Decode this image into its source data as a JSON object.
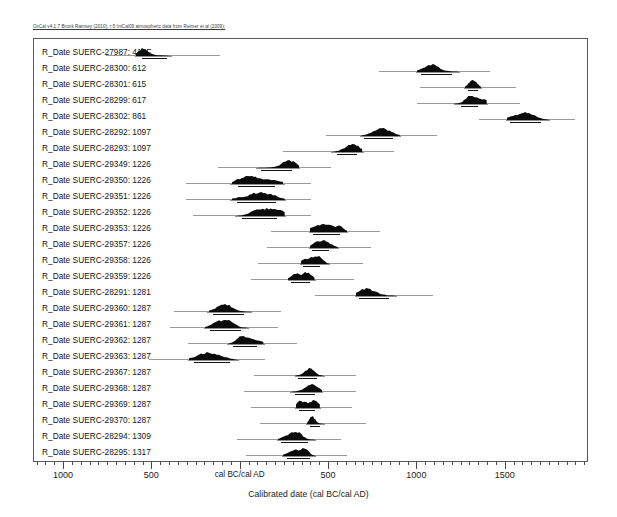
{
  "credit": "OxCal v4.1.7 Bronk Ramsey (2010); r:5 IntCal09 atmospheric data from Reimer et al (2009);",
  "axis": {
    "title": "Calibrated date (cal BC/cal AD)",
    "tick_labels": [
      "1000",
      "500",
      "cal BC/cal AD",
      "500",
      "1000",
      "1500"
    ]
  },
  "chart_data": {
    "type": "area",
    "title": "",
    "subtitle": "OxCal v4.1.7 Bronk Ramsey (2010); r:5 IntCal09 atmospheric data from Reimer et al (2009);",
    "xlabel": "Calibrated date (cal BC/cal AD)",
    "ylabel": "",
    "xlim": [
      -1170,
      1960
    ],
    "xticks": [
      -1000,
      -500,
      0,
      500,
      1000,
      1500
    ],
    "xtick_labels": [
      "1000",
      "500",
      "cal BC/cal AD",
      "500",
      "1000",
      "1500"
    ],
    "grid": false,
    "legend": false,
    "note": "OxCal multiplot of calibrated radiocarbon determinations. Each row shows the calibrated probability distribution (filled black) with 95.4% (grey) and 68.2% (black) highest-posterior-density range bars beneath.",
    "categories": [
      "R_Date SUERC-27987: 415F",
      "R_Date SUERC-28300: 612",
      "R_Date SUERC-28301: 615",
      "R_Date SUERC-28299: 617",
      "R_Date SUERC-28302: 861",
      "R_Date SUERC-28292: 1097",
      "R_Date SUERC-28293: 1097",
      "R_Date SUERC-29349: 1226",
      "R_Date SUERC-29350: 1226",
      "R_Date SUERC-29351: 1226",
      "R_Date SUERC-29352: 1226",
      "R_Date SUERC-29353: 1226",
      "R_Date SUERC-29357: 1226",
      "R_Date SUERC-29358: 1226",
      "R_Date SUERC-29359: 1226",
      "R_Date SUERC-28291: 1281",
      "R_Date SUERC-29360: 1287",
      "R_Date SUERC-29361: 1287",
      "R_Date SUERC-29362: 1287",
      "R_Date SUERC-29363: 1287",
      "R_Date SUERC-29367: 1287",
      "R_Date SUERC-29368: 1287",
      "R_Date SUERC-29369: 1287",
      "R_Date SUERC-29370: 1287",
      "R_Date SUERC-28294: 1309",
      "R_Date SUERC-28295: 1317"
    ],
    "series": [
      {
        "name": "R_Date SUERC-27987: 415F",
        "label": "R_Date SUERC-27987: 415F",
        "c14_age": 415,
        "tail_start": -760,
        "tail_end": -120,
        "pdf_start": -590,
        "pdf_end": -400,
        "range95_start": -600,
        "range95_end": -390,
        "range68_start": -560,
        "range68_end": -420
      },
      {
        "name": "R_Date SUERC-28300: 612",
        "label": "R_Date SUERC-28300: 612",
        "c14_age": 612,
        "tail_start": 780,
        "tail_end": 1410,
        "pdf_start": 1000,
        "pdf_end": 1235,
        "range95_start": 990,
        "range95_end": 1240,
        "range68_start": 1020,
        "range68_end": 1195
      },
      {
        "name": "R_Date SUERC-28301: 615",
        "label": "R_Date SUERC-28301: 615",
        "c14_age": 615,
        "tail_start": 1015,
        "tail_end": 1560,
        "pdf_start": 1270,
        "pdf_end": 1360,
        "range95_start": 1265,
        "range95_end": 1365,
        "range68_start": 1285,
        "range68_end": 1345
      },
      {
        "name": "R_Date SUERC-28299: 617",
        "label": "R_Date SUERC-28299: 617",
        "c14_age": 617,
        "tail_start": 1000,
        "tail_end": 1580,
        "pdf_start": 1210,
        "pdf_end": 1395,
        "range95_start": 1205,
        "range95_end": 1400,
        "range68_start": 1245,
        "range68_end": 1345
      },
      {
        "name": "R_Date SUERC-28302: 861",
        "label": "R_Date SUERC-28302: 861",
        "c14_age": 861,
        "tail_start": 1350,
        "tail_end": 1890,
        "pdf_start": 1505,
        "pdf_end": 1745,
        "range95_start": 1500,
        "range95_end": 1750,
        "range68_start": 1525,
        "range68_end": 1700
      },
      {
        "name": "R_Date SUERC-28292: 1097",
        "label": "R_Date SUERC-28292: 1097",
        "c14_age": 1097,
        "tail_start": 480,
        "tail_end": 1110,
        "pdf_start": 680,
        "pdf_end": 900,
        "range95_start": 675,
        "range95_end": 905,
        "range68_start": 700,
        "range68_end": 860
      },
      {
        "name": "R_Date SUERC-28293: 1097",
        "label": "R_Date SUERC-28293: 1097",
        "c14_age": 1097,
        "tail_start": 240,
        "tail_end": 870,
        "pdf_start": 525,
        "pdf_end": 690,
        "range95_start": 510,
        "range95_end": 700,
        "range68_start": 545,
        "range68_end": 660
      },
      {
        "name": "R_Date SUERC-29349: 1226",
        "label": "R_Date SUERC-29349: 1226",
        "c14_age": 1226,
        "tail_start": -130,
        "tail_end": 510,
        "pdf_start": 90,
        "pdf_end": 330,
        "range95_start": 85,
        "range95_end": 335,
        "range68_start": 115,
        "range68_end": 290
      },
      {
        "name": "R_Date SUERC-29350: 1226",
        "label": "R_Date SUERC-29350: 1226",
        "c14_age": 1226,
        "tail_start": -310,
        "tail_end": 400,
        "pdf_start": -50,
        "pdf_end": 240,
        "range95_start": -60,
        "range95_end": 250,
        "range68_start": -15,
        "range68_end": 195
      },
      {
        "name": "R_Date SUERC-29351: 1226",
        "label": "R_Date SUERC-29351: 1226",
        "c14_age": 1226,
        "tail_start": -310,
        "tail_end": 400,
        "pdf_start": -50,
        "pdf_end": 250,
        "range95_start": -60,
        "range95_end": 255,
        "range68_start": -20,
        "range68_end": 200
      },
      {
        "name": "R_Date SUERC-29352: 1226",
        "label": "R_Date SUERC-29352: 1226",
        "c14_age": 1226,
        "tail_start": -270,
        "tail_end": 400,
        "pdf_start": -20,
        "pdf_end": 250,
        "range95_start": -30,
        "range95_end": 255,
        "range68_start": 5,
        "range68_end": 205
      },
      {
        "name": "R_Date SUERC-29353: 1226",
        "label": "R_Date SUERC-29353: 1226",
        "c14_age": 1226,
        "tail_start": 170,
        "tail_end": 790,
        "pdf_start": 390,
        "pdf_end": 600,
        "range95_start": 385,
        "range95_end": 605,
        "range68_start": 410,
        "range68_end": 560
      },
      {
        "name": "R_Date SUERC-29357: 1226",
        "label": "R_Date SUERC-29357: 1226",
        "c14_age": 1226,
        "tail_start": 150,
        "tail_end": 740,
        "pdf_start": 390,
        "pdf_end": 550,
        "range95_start": 385,
        "range95_end": 555,
        "range68_start": 405,
        "range68_end": 500
      },
      {
        "name": "R_Date SUERC-29358: 1226",
        "label": "R_Date SUERC-29358: 1226",
        "c14_age": 1226,
        "tail_start": 100,
        "tail_end": 690,
        "pdf_start": 340,
        "pdf_end": 500,
        "range95_start": 335,
        "range95_end": 505,
        "range68_start": 355,
        "range68_end": 450
      },
      {
        "name": "R_Date SUERC-29359: 1226",
        "label": "R_Date SUERC-29359: 1226",
        "c14_age": 1226,
        "tail_start": 60,
        "tail_end": 640,
        "pdf_start": 270,
        "pdf_end": 420,
        "range95_start": 265,
        "range95_end": 425,
        "range68_start": 285,
        "range68_end": 395
      },
      {
        "name": "R_Date SUERC-28291: 1281",
        "label": "R_Date SUERC-28291: 1281",
        "c14_age": 1281,
        "tail_start": 420,
        "tail_end": 1090,
        "pdf_start": 650,
        "pdf_end": 880,
        "range95_start": 645,
        "range95_end": 885,
        "range68_start": 670,
        "range68_end": 840
      },
      {
        "name": "R_Date SUERC-29360: 1287",
        "label": "R_Date SUERC-29360: 1287",
        "c14_age": 1287,
        "tail_start": -380,
        "tail_end": 230,
        "pdf_start": -180,
        "pdf_end": 60,
        "range95_start": -190,
        "range95_end": 65,
        "range68_start": -155,
        "range68_end": 20
      },
      {
        "name": "R_Date SUERC-29361: 1287",
        "label": "R_Date SUERC-29361: 1287",
        "c14_age": 1287,
        "tail_start": -400,
        "tail_end": 210,
        "pdf_start": -200,
        "pdf_end": 40,
        "range95_start": -210,
        "range95_end": 45,
        "range68_start": -175,
        "range68_end": 0
      },
      {
        "name": "R_Date SUERC-29362: 1287",
        "label": "R_Date SUERC-29362: 1287",
        "c14_age": 1287,
        "tail_start": -300,
        "tail_end": 320,
        "pdf_start": -70,
        "pdf_end": 130,
        "range95_start": -80,
        "range95_end": 135,
        "range68_start": -45,
        "range68_end": 90
      },
      {
        "name": "R_Date SUERC-29363: 1287",
        "label": "R_Date SUERC-29363: 1287",
        "c14_age": 1287,
        "tail_start": -520,
        "tail_end": 140,
        "pdf_start": -290,
        "pdf_end": -20,
        "range95_start": -300,
        "range95_end": -10,
        "range68_start": -265,
        "range68_end": -60
      },
      {
        "name": "R_Date SUERC-29367: 1287",
        "label": "R_Date SUERC-29367: 1287",
        "c14_age": 1287,
        "tail_start": 75,
        "tail_end": 650,
        "pdf_start": 310,
        "pdf_end": 470,
        "range95_start": 305,
        "range95_end": 475,
        "range68_start": 325,
        "range68_end": 430
      },
      {
        "name": "R_Date SUERC-29368: 1287",
        "label": "R_Date SUERC-29368: 1287",
        "c14_age": 1287,
        "tail_start": 20,
        "tail_end": 650,
        "pdf_start": 290,
        "pdf_end": 460,
        "range95_start": 280,
        "range95_end": 465,
        "range68_start": 310,
        "range68_end": 420
      },
      {
        "name": "R_Date SUERC-29369: 1287",
        "label": "R_Date SUERC-29369: 1287",
        "c14_age": 1287,
        "tail_start": 60,
        "tail_end": 630,
        "pdf_start": 315,
        "pdf_end": 450,
        "range95_start": 310,
        "range95_end": 455,
        "range68_start": 330,
        "range68_end": 420
      },
      {
        "name": "R_Date SUERC-29370: 1287",
        "label": "R_Date SUERC-29370: 1287",
        "c14_age": 1287,
        "tail_start": 110,
        "tail_end": 710,
        "pdf_start": 375,
        "pdf_end": 470,
        "range95_start": 370,
        "range95_end": 475,
        "range68_start": 390,
        "range68_end": 450
      },
      {
        "name": "R_Date SUERC-28294: 1309",
        "label": "R_Date SUERC-28294: 1309",
        "c14_age": 1309,
        "tail_start": -20,
        "tail_end": 570,
        "pdf_start": 210,
        "pdf_end": 420,
        "range95_start": 205,
        "range95_end": 425,
        "range68_start": 230,
        "range68_end": 380
      },
      {
        "name": "R_Date SUERC-28295: 1317",
        "label": "R_Date SUERC-28295: 1317",
        "c14_age": 1317,
        "tail_start": 30,
        "tail_end": 600,
        "pdf_start": 240,
        "pdf_end": 420,
        "range95_start": 235,
        "range95_end": 425,
        "range68_start": 260,
        "range68_end": 390
      }
    ]
  }
}
